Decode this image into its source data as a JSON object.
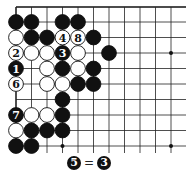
{
  "board": {
    "origin_x": 16,
    "origin_y": 22,
    "spacing": 15.5,
    "top_edge_y": 7,
    "left_edge_x": 16,
    "columns_visible": 12,
    "rows_visible": 10,
    "star_points": [
      [
        10,
        2
      ],
      [
        3,
        8
      ],
      [
        10,
        8
      ]
    ],
    "stones": [
      {
        "c": 0,
        "r": 0,
        "color": "black"
      },
      {
        "c": 1,
        "r": 0,
        "color": "black"
      },
      {
        "c": 3,
        "r": 0,
        "color": "black"
      },
      {
        "c": 4,
        "r": 0,
        "color": "black"
      },
      {
        "c": 0,
        "r": 1,
        "color": "white"
      },
      {
        "c": 1,
        "r": 1,
        "color": "black"
      },
      {
        "c": 2,
        "r": 1,
        "color": "black"
      },
      {
        "c": 3,
        "r": 1,
        "color": "white",
        "label": "4"
      },
      {
        "c": 4,
        "r": 1,
        "color": "white",
        "label": "8"
      },
      {
        "c": 5,
        "r": 1,
        "color": "black"
      },
      {
        "c": 0,
        "r": 2,
        "color": "white",
        "label": "2"
      },
      {
        "c": 1,
        "r": 2,
        "color": "white"
      },
      {
        "c": 2,
        "r": 2,
        "color": "white"
      },
      {
        "c": 3,
        "r": 2,
        "color": "black",
        "label": "3"
      },
      {
        "c": 4,
        "r": 2,
        "color": "white"
      },
      {
        "c": 6,
        "r": 2,
        "color": "black"
      },
      {
        "c": 0,
        "r": 3,
        "color": "black",
        "label": "1"
      },
      {
        "c": 2,
        "r": 3,
        "color": "white"
      },
      {
        "c": 3,
        "r": 3,
        "color": "black"
      },
      {
        "c": 4,
        "r": 3,
        "color": "white"
      },
      {
        "c": 5,
        "r": 3,
        "color": "black"
      },
      {
        "c": 0,
        "r": 4,
        "color": "white",
        "label": "6"
      },
      {
        "c": 2,
        "r": 4,
        "color": "white"
      },
      {
        "c": 3,
        "r": 4,
        "color": "white"
      },
      {
        "c": 4,
        "r": 4,
        "color": "black"
      },
      {
        "c": 5,
        "r": 4,
        "color": "black"
      },
      {
        "c": 3,
        "r": 5,
        "color": "black"
      },
      {
        "c": 0,
        "r": 6,
        "color": "black",
        "label": "7"
      },
      {
        "c": 1,
        "r": 6,
        "color": "white"
      },
      {
        "c": 2,
        "r": 6,
        "color": "white"
      },
      {
        "c": 3,
        "r": 6,
        "color": "black"
      },
      {
        "c": 0,
        "r": 7,
        "color": "white"
      },
      {
        "c": 1,
        "r": 7,
        "color": "black"
      },
      {
        "c": 2,
        "r": 7,
        "color": "black"
      },
      {
        "c": 3,
        "r": 7,
        "color": "black"
      },
      {
        "c": 0,
        "r": 8,
        "color": "black"
      },
      {
        "c": 1,
        "r": 8,
        "color": "black"
      }
    ]
  },
  "caption": {
    "left_stone": "5",
    "equals": "=",
    "right_stone": "3"
  }
}
